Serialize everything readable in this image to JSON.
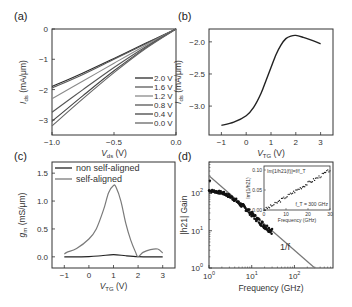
{
  "chart_data": [
    {
      "panel": "(a)",
      "type": "line",
      "xlabel": "V_ds (V)",
      "xlabel_main": "V",
      "xlabel_sub": "ds",
      "xlabel_unit": " (V)",
      "ylabel_main": "I",
      "ylabel_sub": "ds",
      "ylabel_unit": " (mA/μm)",
      "xlim": [
        -1.0,
        0.0
      ],
      "ylim": [
        -3.5,
        0.0
      ],
      "xticks": [
        -1.0,
        -0.5,
        0.0
      ],
      "xtick_labels": [
        "−1.0",
        "−0.5",
        "0.0"
      ],
      "yticks": [
        0,
        -1,
        -2,
        -3
      ],
      "ytick_labels": [
        "0",
        "−1",
        "−2",
        "−3"
      ],
      "legend_position": "right",
      "series": [
        {
          "name": "2.0 V",
          "color": "#2a2a2a",
          "x": [
            -1.0,
            -0.75,
            -0.5,
            -0.25,
            0.0
          ],
          "y": [
            -1.9,
            -1.45,
            -0.97,
            -0.48,
            0.0
          ]
        },
        {
          "name": "1.6 V",
          "color": "#5a5a5a",
          "x": [
            -1.0,
            -0.75,
            -0.5,
            -0.25,
            0.0
          ],
          "y": [
            -1.95,
            -1.5,
            -1.0,
            -0.5,
            0.0
          ]
        },
        {
          "name": "1.2 V",
          "color": "#8a8a8a",
          "x": [
            -1.0,
            -0.75,
            -0.5,
            -0.25,
            0.0
          ],
          "y": [
            -2.3,
            -1.72,
            -1.13,
            -0.55,
            0.0
          ]
        },
        {
          "name": "0.8 V",
          "color": "#555555",
          "x": [
            -1.0,
            -0.75,
            -0.5,
            -0.25,
            0.0
          ],
          "y": [
            -2.75,
            -2.0,
            -1.27,
            -0.6,
            0.0
          ]
        },
        {
          "name": "0.4 V",
          "color": "#444444",
          "x": [
            -1.0,
            -0.75,
            -0.5,
            -0.25,
            0.0
          ],
          "y": [
            -3.05,
            -2.2,
            -1.38,
            -0.64,
            0.0
          ]
        },
        {
          "name": "0.0 V",
          "color": "#666666",
          "x": [
            -1.0,
            -0.75,
            -0.5,
            -0.25,
            0.0
          ],
          "y": [
            -3.2,
            -2.3,
            -1.44,
            -0.66,
            0.0
          ]
        }
      ]
    },
    {
      "panel": "(b)",
      "type": "line",
      "xlabel_main": "V",
      "xlabel_sub": "TG",
      "xlabel_unit": " (V)",
      "ylabel_main": "I",
      "ylabel_sub": "ds",
      "ylabel_unit": " (mA/μm)",
      "xlim": [
        -1.5,
        3.5
      ],
      "ylim": [
        -3.45,
        -1.8
      ],
      "xticks": [
        -1,
        0,
        1,
        2,
        3
      ],
      "xtick_labels": [
        "−1",
        "0",
        "1",
        "2",
        "3"
      ],
      "yticks": [
        -2.0,
        -2.5,
        -3.0
      ],
      "ytick_labels": [
        "−2.0",
        "−2.5",
        "−3.0"
      ],
      "series": [
        {
          "name": "I_ds",
          "color": "#222222",
          "x": [
            -1.0,
            -0.5,
            0.0,
            0.3,
            0.6,
            0.8,
            1.0,
            1.2,
            1.4,
            1.6,
            1.8,
            2.0,
            2.3,
            2.6,
            3.0
          ],
          "y": [
            -3.3,
            -3.25,
            -3.15,
            -3.02,
            -2.8,
            -2.6,
            -2.4,
            -2.2,
            -2.05,
            -1.95,
            -1.91,
            -1.9,
            -1.93,
            -1.97,
            -2.03
          ]
        }
      ]
    },
    {
      "panel": "(c)",
      "type": "line",
      "xlabel_main": "V",
      "xlabel_sub": "TG",
      "xlabel_unit": " (V)",
      "ylabel_main": "g",
      "ylabel_sub": "m",
      "ylabel_unit": " (mS/μm)",
      "xlim": [
        -1.5,
        3.5
      ],
      "ylim": [
        -0.2,
        1.7
      ],
      "xticks": [
        -1,
        0,
        1,
        2,
        3
      ],
      "xtick_labels": [
        "−1",
        "0",
        "1",
        "2",
        "3"
      ],
      "yticks": [
        0.0,
        0.5,
        1.0,
        1.5
      ],
      "ytick_labels": [
        "0.0",
        "0.5",
        "1.0",
        "1.5"
      ],
      "legend_position": "top-left",
      "series": [
        {
          "name": "non self-aligned",
          "color": "#222222",
          "x": [
            -1.0,
            0.0,
            0.5,
            1.0,
            1.5,
            2.0,
            2.5,
            3.0
          ],
          "y": [
            0.0,
            0.005,
            0.02,
            0.04,
            0.02,
            0.005,
            0.0,
            0.0
          ]
        },
        {
          "name": "self-aligned",
          "color": "#7a7a7a",
          "x": [
            -1.0,
            -0.9,
            -0.5,
            0.0,
            0.3,
            0.6,
            0.8,
            1.0,
            1.1,
            1.3,
            1.5,
            1.7,
            1.9,
            2.0,
            2.2,
            2.5,
            2.8,
            3.0
          ],
          "y": [
            0.05,
            0.08,
            0.15,
            0.32,
            0.5,
            0.85,
            1.15,
            1.28,
            1.25,
            1.0,
            0.6,
            0.3,
            0.08,
            0.0,
            0.08,
            0.13,
            0.14,
            0.07
          ]
        }
      ]
    },
    {
      "panel": "(d)",
      "type": "scatter",
      "xscale": "log",
      "yscale": "log",
      "xlabel": "Frequency (GHz)",
      "ylabel": "|h21| Gain",
      "xlim": [
        1,
        800
      ],
      "ylim": [
        1,
        700
      ],
      "xticks": [
        1,
        10,
        100
      ],
      "xtick_labels": [
        [
          "10",
          "0"
        ],
        [
          "10",
          "1"
        ],
        [
          "10",
          "2"
        ]
      ],
      "yticks": [
        1,
        10,
        100
      ],
      "ytick_labels": [
        [
          "10",
          "0"
        ],
        [
          "10",
          "1"
        ],
        [
          "10",
          "2"
        ]
      ],
      "annotation": "1/f",
      "series": [
        {
          "name": "measured |h21|",
          "color": "#111111",
          "x": [
            1.0,
            1.3,
            1.6,
            2.0,
            2.5,
            3.0,
            4.0,
            5.0,
            6.0,
            8.0,
            10,
            12,
            15,
            18,
            22,
            26,
            30
          ],
          "y": [
            120,
            115,
            110,
            105,
            95,
            85,
            70,
            55,
            47,
            36,
            28,
            23,
            18,
            15,
            12.5,
            11,
            10
          ]
        },
        {
          "name": "1/f fit",
          "color": "#777777",
          "type": "line",
          "x": [
            1,
            300
          ],
          "y": [
            300,
            1
          ]
        }
      ],
      "inset": {
        "type": "scatter",
        "xlabel": "Frequency (GHz)",
        "ylabel": "Im(1/h21)",
        "title": "Im[1/h21(f)]=f/f_T",
        "annotation": "f_T = 300 GHz",
        "xlim": [
          0,
          30
        ],
        "ylim": [
          0,
          0.11
        ],
        "xticks": [
          0,
          10,
          20,
          30
        ],
        "xtick_labels": [
          "0",
          "10",
          "20",
          "30"
        ],
        "yticks": [
          0.0,
          0.05,
          0.1
        ],
        "ytick_labels": [
          "0.00",
          "0.05",
          "0.10"
        ],
        "series": [
          {
            "name": "data",
            "x": [
              0,
              5,
              10,
              15,
              20,
              25,
              30
            ],
            "y": [
              0.0,
              0.015,
              0.033,
              0.05,
              0.067,
              0.083,
              0.1
            ]
          }
        ]
      }
    }
  ]
}
